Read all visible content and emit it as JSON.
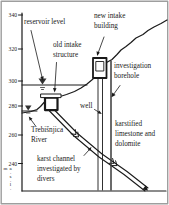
{
  "figure": {
    "type": "hydrogeological cross-section",
    "labels": {
      "reservoir_level": "reservoir level",
      "old_intake": "old intake structure",
      "new_intake": "new intake building",
      "investigation_borehole": "investigation borehole",
      "well": "well",
      "karstified": "karstified limestone and dolomite",
      "river": "Trebišnjica River",
      "karst_channel": "karst channel investigated by divers"
    },
    "axis": {
      "unit": "m a.s.l.",
      "ticks": [
        "340",
        "320",
        "300",
        "280",
        "260",
        "240"
      ]
    },
    "colors": {
      "line": "#1a1a1a",
      "borehole": "#3a3a3a",
      "frame": "#9e9e9e",
      "background": "#ffffff"
    }
  }
}
